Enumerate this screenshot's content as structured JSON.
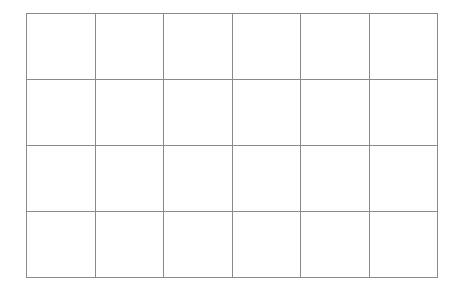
{
  "grid": {
    "rows": 4,
    "columns": 6,
    "line_color": "#8a8a8a",
    "background": "#ffffff",
    "cells": [
      [
        "",
        "",
        "",
        "",
        "",
        ""
      ],
      [
        "",
        "",
        "",
        "",
        "",
        ""
      ],
      [
        "",
        "",
        "",
        "",
        "",
        ""
      ],
      [
        "",
        "",
        "",
        "",
        "",
        ""
      ]
    ]
  }
}
